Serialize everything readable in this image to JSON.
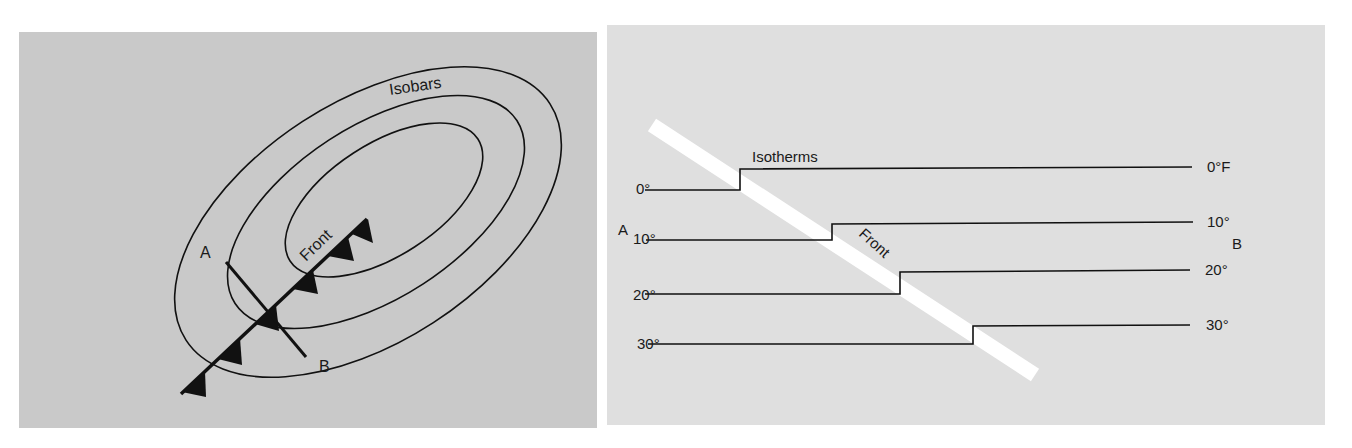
{
  "figure": {
    "colors": {
      "page_background": "#ffffff",
      "left_panel_fill": "#c9c9c9",
      "right_panel_fill": "#dfdfdf",
      "line": "#111111",
      "front_strip": "#ffffff"
    },
    "left_panel": {
      "title_label": "Isobars",
      "front_label": "Front",
      "point_a": "A",
      "point_b": "B"
    },
    "right_panel": {
      "title_label": "Isotherms",
      "front_label": "Front",
      "point_a": "A",
      "point_b": "B",
      "isotherms": [
        {
          "left_label": "0°",
          "right_label": "0°F"
        },
        {
          "left_label": "10°",
          "right_label": "10°"
        },
        {
          "left_label": "20°",
          "right_label": "20°"
        },
        {
          "left_label": "30°",
          "right_label": "30°"
        }
      ]
    }
  }
}
